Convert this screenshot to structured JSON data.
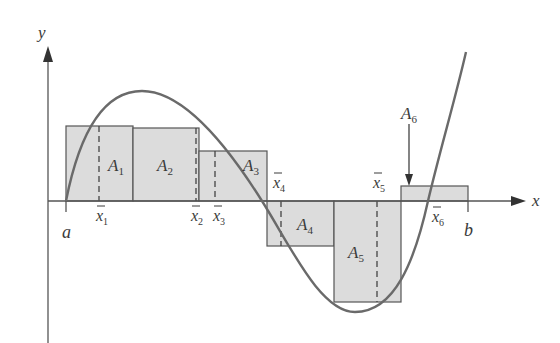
{
  "diagram": {
    "type": "riemann-sum-rectangles",
    "axes": {
      "x_label": "x",
      "y_label": "y"
    },
    "interval": {
      "start_label": "a",
      "end_label": "b"
    },
    "colors": {
      "rect_fill": "#dcdcdc",
      "rect_stroke": "#555555",
      "curve": "#6a6a6a",
      "axis": "#555555",
      "text": "#3a3a3a"
    },
    "rectangles": [
      {
        "name": "A",
        "sub": "1",
        "xbar": "x",
        "xbar_sub": "1"
      },
      {
        "name": "A",
        "sub": "2",
        "xbar": "x",
        "xbar_sub": "2"
      },
      {
        "name": "A",
        "sub": "3",
        "xbar": "x",
        "xbar_sub": "3"
      },
      {
        "name": "A",
        "sub": "4",
        "xbar": "x",
        "xbar_sub": "4"
      },
      {
        "name": "A",
        "sub": "5",
        "xbar": "x",
        "xbar_sub": "5"
      },
      {
        "name": "A",
        "sub": "6",
        "xbar": "x",
        "xbar_sub": "6"
      }
    ],
    "callout": {
      "name": "A",
      "sub": "6"
    }
  }
}
